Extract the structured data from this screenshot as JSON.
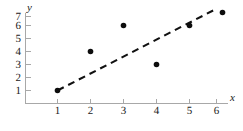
{
  "chart_data": {
    "type": "scatter",
    "title": "",
    "subtitle": "",
    "xlabel": "x",
    "ylabel": "y",
    "x": [
      1,
      2,
      3,
      4,
      5,
      6
    ],
    "values": [
      1,
      4,
      6,
      3,
      6,
      7
    ],
    "points": [
      {
        "x": 1,
        "y": 1
      },
      {
        "x": 2,
        "y": 4
      },
      {
        "x": 3,
        "y": 6
      },
      {
        "x": 4,
        "y": 3
      },
      {
        "x": 5,
        "y": 6
      },
      {
        "x": 6,
        "y": 7
      }
    ],
    "xlim": [
      0,
      6.55
    ],
    "ylim": [
      0,
      7.6
    ],
    "xticks": [
      1,
      2,
      3,
      4,
      5,
      6
    ],
    "yticks": [
      1,
      2,
      3,
      4,
      5,
      6,
      7
    ],
    "xtick_labels": [
      "1",
      "2",
      "3",
      "4",
      "5",
      "6"
    ],
    "ytick_labels": [
      "1",
      "2",
      "3",
      "4",
      "5",
      "6",
      "7"
    ],
    "grid": false,
    "legend": null,
    "legend_position": "none",
    "annotations": [],
    "trend_line": {
      "style": "dashed",
      "x_start": 1,
      "y_start": 1,
      "x_end": 5.75,
      "y_end": 7.2
    },
    "colors": {
      "marker": "#0d0d0d",
      "trend_line": "#111111",
      "axis": "#a8a8a8",
      "text": "#1a1a1a",
      "background": "#ffffff"
    }
  }
}
